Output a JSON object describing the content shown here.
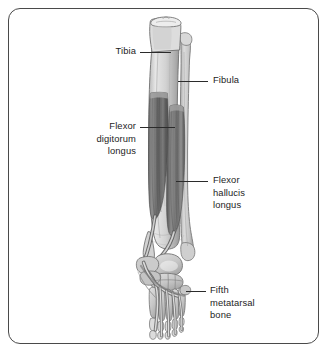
{
  "figure": {
    "frame": {
      "border_color": "#4a4a4a",
      "background_color": "#ffffff",
      "corner_radius": "12px"
    },
    "palette": {
      "bone_light": "#e3e3e3",
      "bone_mid": "#c9c9c9",
      "bone_shadow": "#a8a8a8",
      "bone_outline": "#6f6f6f",
      "muscle_dark": "#5c5c5c",
      "muscle_mid": "#7b7b7b",
      "muscle_light": "#9a9a9a",
      "tendon": "#d5d5d5",
      "tendon_outline": "#6a6a6a",
      "text": "#1d1d1d",
      "leader": "#2b2b2b"
    },
    "labels": [
      {
        "id": "tibia",
        "text": "Tibia",
        "align": "right",
        "text_x": 84,
        "text_y": 45,
        "text_width": 52,
        "leader": {
          "x1": 140,
          "y1": 51.5,
          "x2": 171,
          "y2": 51.5
        }
      },
      {
        "id": "fibula",
        "text": "Fibula",
        "align": "left",
        "text_x": 213,
        "text_y": 74,
        "text_width": 70,
        "leader": {
          "x1": 178,
          "y1": 80.5,
          "x2": 208,
          "y2": 80.5
        }
      },
      {
        "id": "flexor-digitorum-longus",
        "text": "Flexor\ndigitorum\nlongus",
        "align": "right",
        "text_x": 62,
        "text_y": 120,
        "text_width": 74,
        "leader": {
          "x1": 140,
          "y1": 126.5,
          "x2": 175,
          "y2": 126.5
        }
      },
      {
        "id": "flexor-hallucis-longus",
        "text": "Flexor\nhallucis\nlongus",
        "align": "left",
        "text_x": 213,
        "text_y": 174,
        "text_width": 74,
        "leader": {
          "x1": 176,
          "y1": 181,
          "x2": 208,
          "y2": 181
        }
      },
      {
        "id": "fifth-metatarsal-bone",
        "text": "Fifth\nmetatarsal\nbone",
        "align": "left",
        "text_x": 210,
        "text_y": 284,
        "text_width": 80,
        "leader": {
          "x1": 186,
          "y1": 291,
          "x2": 206,
          "y2": 291
        }
      }
    ],
    "structures": [
      {
        "name": "tibia",
        "kind": "bone",
        "region": "lower-leg-medial"
      },
      {
        "name": "fibula",
        "kind": "bone",
        "region": "lower-leg-lateral"
      },
      {
        "name": "flexor-digitorum-longus",
        "kind": "muscle",
        "region": "deep-posterior-compartment"
      },
      {
        "name": "flexor-hallucis-longus",
        "kind": "muscle",
        "region": "deep-posterior-compartment"
      },
      {
        "name": "talus",
        "kind": "bone",
        "region": "ankle"
      },
      {
        "name": "calcaneus",
        "kind": "bone",
        "region": "hindfoot"
      },
      {
        "name": "tarsal-bones",
        "kind": "bone",
        "region": "midfoot"
      },
      {
        "name": "metatarsal-bones",
        "kind": "bone",
        "region": "forefoot"
      },
      {
        "name": "phalanges",
        "kind": "bone",
        "region": "toes"
      },
      {
        "name": "flexor-tendons",
        "kind": "tendon",
        "region": "plantar-foot"
      }
    ]
  }
}
